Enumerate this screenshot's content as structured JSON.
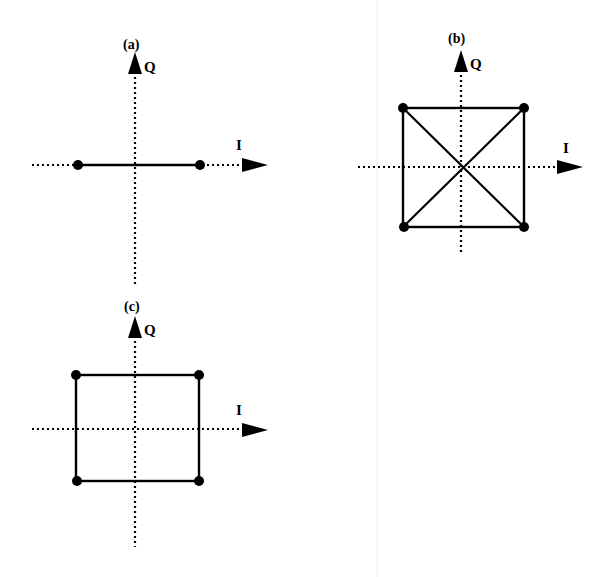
{
  "figure": {
    "ink_color": "#000000",
    "background": "#ffffff",
    "separator_color": "#ececec"
  },
  "panels": [
    {
      "id": "a",
      "label": "(a)",
      "x_axis_label": "I",
      "y_axis_label": "Q",
      "points": [
        [
          -1,
          0
        ],
        [
          1,
          0
        ]
      ],
      "shape": "line-segment"
    },
    {
      "id": "b",
      "label": "(b)",
      "x_axis_label": "I",
      "y_axis_label": "Q",
      "points": [
        [
          -1,
          1
        ],
        [
          1,
          1
        ],
        [
          -1,
          -1
        ],
        [
          1,
          -1
        ]
      ],
      "shape": "square-with-diagonals"
    },
    {
      "id": "c",
      "label": "(c)",
      "x_axis_label": "I",
      "y_axis_label": "Q",
      "points": [
        [
          -1,
          1
        ],
        [
          1,
          1
        ],
        [
          -1,
          -1
        ],
        [
          1,
          -1
        ]
      ],
      "shape": "square"
    }
  ]
}
